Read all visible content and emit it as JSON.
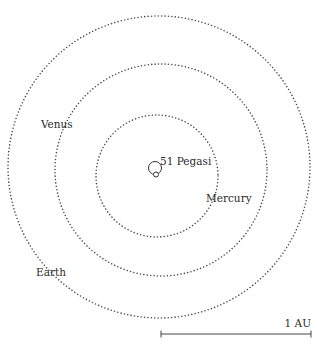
{
  "diagram": {
    "star": {
      "label": "51 Pegasi",
      "cx": 155,
      "cy": 168,
      "orbit_r": 6.5,
      "planet_cx": 156,
      "planet_cy": 174.5,
      "planet_r": 2.5
    },
    "orbits": [
      {
        "name": "Mercury",
        "cx": 157,
        "cy": 176,
        "r": 61,
        "label_x": 206,
        "label_y": 202
      },
      {
        "name": "Venus",
        "cx": 161,
        "cy": 170,
        "r": 106,
        "label_x": 41,
        "label_y": 128
      },
      {
        "name": "Earth",
        "cx": 159,
        "cy": 167,
        "r": 151,
        "label_x": 36,
        "label_y": 276
      }
    ],
    "scale_bar": {
      "label": "1 AU",
      "x1": 161,
      "x2": 311,
      "y": 334,
      "label_x": 311,
      "label_y": 327
    },
    "colors": {
      "dots": "#4a4a4a",
      "text": "#2a2a2a",
      "background": "#ffffff"
    }
  }
}
